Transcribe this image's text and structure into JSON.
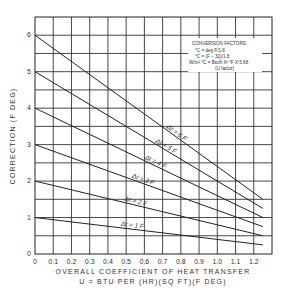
{
  "chart_data": {
    "type": "line",
    "title": "",
    "xlabel": "OVERALL COEFFICIENT OF HEAT TRANSFER",
    "xlabel_2": "U = BTU PER (HR)(SQ FT)(F DEG)",
    "ylabel": "CORRECTION (F DEG)",
    "xlim": [
      0,
      1.3
    ],
    "ylim": [
      0,
      6.5
    ],
    "grid": true,
    "x_ticks": [
      "0",
      "0.1",
      "0.2",
      "0.3",
      "0.4",
      "0.5",
      "0.6",
      "0.7",
      "0.8",
      "0.9",
      "1.0",
      "1.1",
      "1.2"
    ],
    "y_ticks": [
      "0",
      "1",
      "2",
      "3",
      "4",
      "5",
      "6"
    ],
    "x": [
      0,
      1.25
    ],
    "series": [
      {
        "name": "Δt = 6 F",
        "values": [
          6.0,
          1.5
        ]
      },
      {
        "name": "Δt = 5 F",
        "values": [
          5.0,
          1.25
        ]
      },
      {
        "name": "Δt = 4 F",
        "values": [
          4.0,
          1.0
        ]
      },
      {
        "name": "Δt = 3 F",
        "values": [
          3.0,
          0.75
        ]
      },
      {
        "name": "Δt = 2 F",
        "values": [
          2.0,
          0.5
        ]
      },
      {
        "name": "Δt = 1 F",
        "values": [
          1.0,
          0.25
        ]
      }
    ],
    "annotations": {
      "conversion_title": "CONVERSION FACTORS",
      "conversion_lines": [
        "°C = deg F/1.8",
        "°C = (F − 32)/1.8",
        "W/m² °C = Btu/h ft² °F X 5.68",
        "(U factor)"
      ]
    }
  }
}
